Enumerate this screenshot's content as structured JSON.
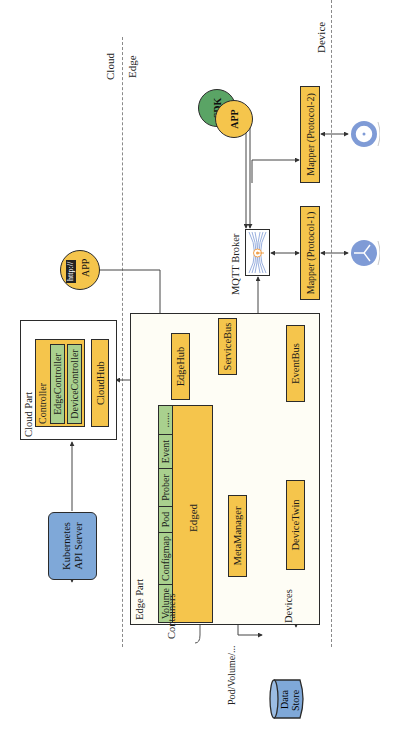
{
  "regions": {
    "cloud": "Cloud",
    "edge": "Edge",
    "device": "Device"
  },
  "cloud_part": {
    "title": "Cloud Part",
    "controller": {
      "label": "Controller",
      "children": [
        "EdgeController",
        "DeviceController"
      ]
    },
    "cloudhub": "CloudHub"
  },
  "kubernetes": {
    "line1": "Kubernetes",
    "line2": "API Server",
    "kubectl": "kubectl"
  },
  "edge_part": {
    "title": "Edge Part",
    "edged": {
      "label": "Edged",
      "modules": [
        "Volume",
        "Configmap",
        "Pod",
        "Prober",
        "Event",
        "......"
      ]
    },
    "edgehub": "EdgeHub",
    "servicebus": "ServiceBus",
    "eventbus": "EventBus",
    "metamanager": "MetaManager",
    "devicetwin": "DeviceTwin"
  },
  "external": {
    "http_app": {
      "badge": "http://",
      "label": "APP"
    },
    "mqtt_broker": "MQTT Broker",
    "sdk": "SDK",
    "app": "APP",
    "mapper1": "Mapper (Protocol-1)",
    "mapper2": "Mapper (Protocol-2)",
    "containers": "Containers",
    "pod_volume": "Pod/Volume/...",
    "devices": "Devices",
    "data_store": {
      "line1": "Data",
      "line2": "Store"
    }
  },
  "colors": {
    "module_yellow": "#f5c54c",
    "submodule_green": "#a9d08e",
    "kubernetes_blue": "#7fa8d8",
    "sdk_green": "#5aa465",
    "device_blue": "#7f9bd6",
    "mqtt_orange": "#f0a04b"
  }
}
